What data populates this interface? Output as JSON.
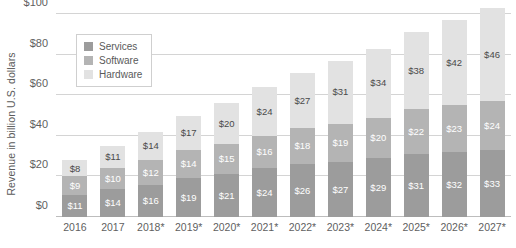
{
  "chart_data": {
    "type": "bar",
    "subtype": "stacked-bar",
    "title": "",
    "subtitle": "",
    "xlabel": "",
    "ylabel": "Revenue in billion U.S. dollars",
    "ylim": [
      0,
      100
    ],
    "ytick_values": [
      0,
      20,
      40,
      60,
      80,
      100
    ],
    "ytick_labels": [
      "$0",
      "$20",
      "$40",
      "$60",
      "$80",
      "$100"
    ],
    "grid": true,
    "legend_position": "top-left-inside",
    "categories": [
      "2016",
      "2017",
      "2018*",
      "2019*",
      "2020*",
      "2021*",
      "2022*",
      "2023*",
      "2024*",
      "2025*",
      "2026*",
      "2027*"
    ],
    "series": [
      {
        "name": "Services",
        "color": "#9c9c9c",
        "values": [
          11,
          14,
          16,
          19,
          21,
          24,
          26,
          27,
          29,
          31,
          32,
          33
        ],
        "labels": [
          "$11",
          "$14",
          "$16",
          "$19",
          "$21",
          "$24",
          "$26",
          "$27",
          "$29",
          "$31",
          "$32",
          "$33"
        ]
      },
      {
        "name": "Software",
        "color": "#b4b4b4",
        "values": [
          9,
          10,
          12,
          14,
          15,
          16,
          18,
          19,
          20,
          22,
          23,
          24
        ],
        "labels": [
          "$9",
          "$10",
          "$12",
          "$14",
          "$15",
          "$16",
          "$18",
          "$19",
          "$20",
          "$22",
          "$23",
          "$24"
        ]
      },
      {
        "name": "Hardware",
        "color": "#e2e2e2",
        "values": [
          8,
          11,
          14,
          17,
          20,
          24,
          27,
          31,
          34,
          38,
          42,
          46
        ],
        "labels": [
          "$8",
          "$11",
          "$14",
          "$17",
          "$20",
          "$24",
          "$27",
          "$31",
          "$34",
          "$38",
          "$42",
          "$46"
        ]
      }
    ],
    "stack_order_bottom_to_top": [
      "Services",
      "Software",
      "Hardware"
    ]
  },
  "legend": {
    "items": [
      {
        "label": "Services",
        "swatch_class": "sw-services"
      },
      {
        "label": "Software",
        "swatch_class": "sw-software"
      },
      {
        "label": "Hardware",
        "swatch_class": "sw-hardware"
      }
    ]
  }
}
